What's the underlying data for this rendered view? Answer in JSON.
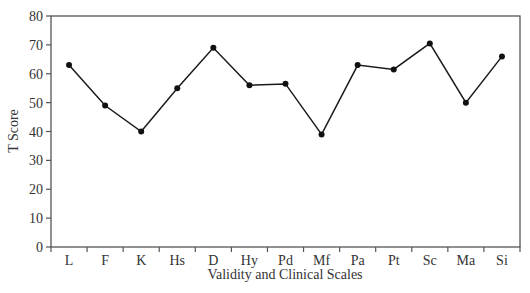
{
  "chart_data": {
    "type": "line",
    "title": "",
    "xlabel": "Validity and Clinical Scales",
    "ylabel": "T Score",
    "categories": [
      "L",
      "F",
      "K",
      "Hs",
      "D",
      "Hy",
      "Pd",
      "Mf",
      "Pa",
      "Pt",
      "Sc",
      "Ma",
      "Si"
    ],
    "series": [
      {
        "name": "T Score",
        "values": [
          63,
          49,
          40,
          55,
          69,
          56,
          56.5,
          39,
          63,
          61.5,
          70.5,
          50,
          66
        ]
      }
    ],
    "ylim": [
      0,
      80
    ],
    "yticks": [
      0,
      10,
      20,
      30,
      40,
      50,
      60,
      70,
      80
    ],
    "grid": false,
    "legend": "none",
    "markers": "filled circles",
    "line_color": "#1a1a1a"
  }
}
